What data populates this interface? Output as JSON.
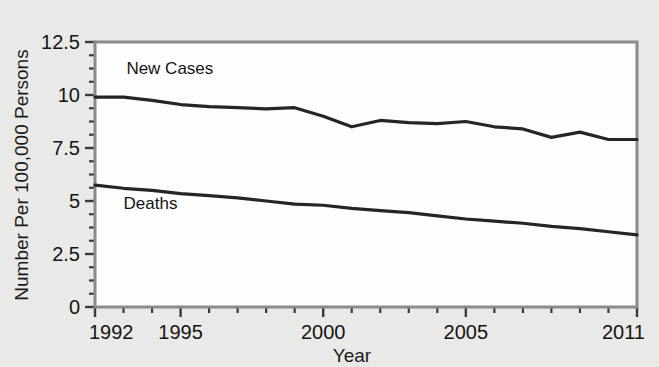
{
  "chart_data": {
    "type": "line",
    "title": "",
    "xlabel": "Year",
    "ylabel": "Number Per 100,000 Persons",
    "xlim": [
      1992,
      2011
    ],
    "ylim": [
      0,
      12.5
    ],
    "grid": false,
    "legend_position": "inline-annotation",
    "x_tick_labels": [
      "1992",
      "1995",
      "2000",
      "2005",
      "2011"
    ],
    "x_tick_values": [
      1992,
      1995,
      2000,
      2005,
      2011
    ],
    "x_minor_tick_interval": 1,
    "y_tick_labels": [
      "0",
      "2.5",
      "5",
      "7.5",
      "10",
      "12.5"
    ],
    "y_tick_values": [
      0,
      2.5,
      5,
      7.5,
      10,
      12.5
    ],
    "y_minor_tick_interval": 0.625,
    "x": [
      1992,
      1993,
      1994,
      1995,
      1996,
      1997,
      1998,
      1999,
      2000,
      2001,
      2002,
      2003,
      2004,
      2005,
      2006,
      2007,
      2008,
      2009,
      2010,
      2011
    ],
    "series": [
      {
        "name": "New Cases",
        "label_x": 1993.1,
        "label_y": 11.0,
        "color": "#252525",
        "values": [
          9.9,
          9.9,
          9.75,
          9.55,
          9.45,
          9.4,
          9.35,
          9.4,
          9.0,
          8.5,
          8.8,
          8.7,
          8.65,
          8.75,
          8.5,
          8.4,
          8.0,
          8.25,
          7.9,
          7.9
        ]
      },
      {
        "name": "Deaths",
        "label_x": 1993.0,
        "label_y": 4.6,
        "color": "#252525",
        "values": [
          5.75,
          5.6,
          5.5,
          5.35,
          5.25,
          5.15,
          5.0,
          4.85,
          4.8,
          4.65,
          4.55,
          4.45,
          4.3,
          4.15,
          4.05,
          3.95,
          3.8,
          3.7,
          3.55,
          3.4
        ]
      }
    ]
  },
  "figure": {
    "background_color": "#e9e9e7",
    "plot_background_color": "#fdfdfd",
    "frame_color": "#8a8a8a"
  }
}
